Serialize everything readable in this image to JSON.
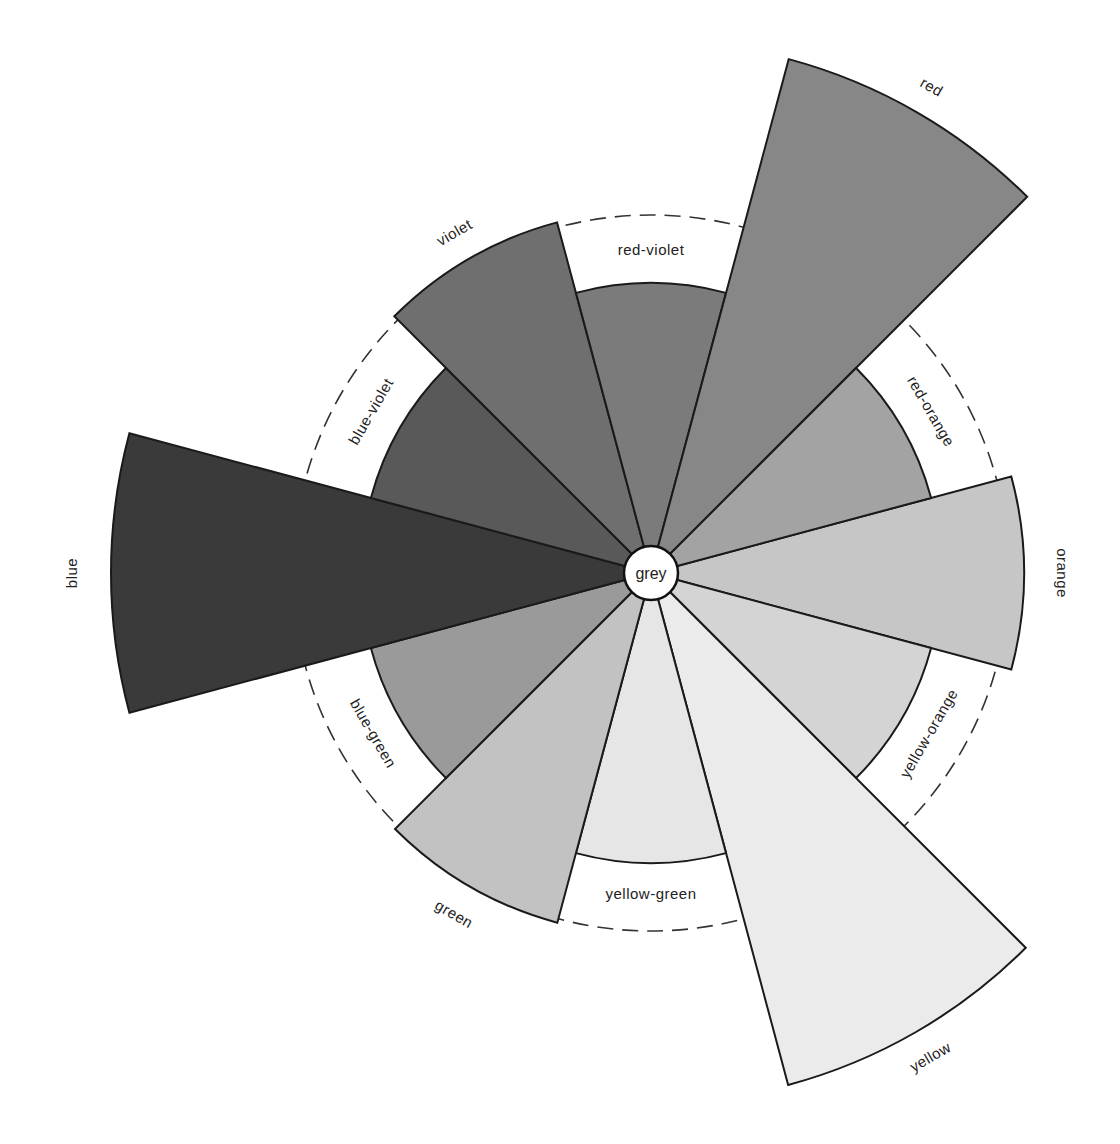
{
  "chart_data": {
    "type": "polar-area",
    "title": "",
    "center_label": "grey",
    "angle_convention": "degrees clockwise from east (screen)",
    "sector_width_deg": 30,
    "reference_ring_radius": 358,
    "inner_disc_radius": 290,
    "categories": [
      "orange",
      "yellow-orange",
      "yellow",
      "yellow-green",
      "green",
      "blue-green",
      "blue",
      "blue-violet",
      "violet",
      "red-violet",
      "red",
      "red-orange"
    ],
    "sectors": [
      {
        "name": "orange",
        "center_angle": 0,
        "radius": 373,
        "tone": "#c6c6c6",
        "label_radius": 410,
        "label_mode": "outer"
      },
      {
        "name": "yellow-orange",
        "center_angle": 30,
        "radius": 290,
        "tone": "#d4d4d4",
        "label_radius": 322,
        "label_mode": "band"
      },
      {
        "name": "yellow",
        "center_angle": 60,
        "radius": 530,
        "tone": "#ebebeb",
        "label_radius": 560,
        "label_mode": "outer"
      },
      {
        "name": "yellow-green",
        "center_angle": 90,
        "radius": 290,
        "tone": "#e6e6e6",
        "label_radius": 322,
        "label_mode": "band"
      },
      {
        "name": "green",
        "center_angle": 120,
        "radius": 362,
        "tone": "#c2c2c2",
        "label_radius": 395,
        "label_mode": "outer"
      },
      {
        "name": "blue-green",
        "center_angle": 150,
        "radius": 290,
        "tone": "#9a9a9a",
        "label_radius": 322,
        "label_mode": "band"
      },
      {
        "name": "blue",
        "center_angle": 180,
        "radius": 540,
        "tone": "#3a3a3a",
        "label_radius": 578,
        "label_mode": "outer"
      },
      {
        "name": "blue-violet",
        "center_angle": 210,
        "radius": 290,
        "tone": "#595959",
        "label_radius": 322,
        "label_mode": "band"
      },
      {
        "name": "violet",
        "center_angle": 240,
        "radius": 363,
        "tone": "#6f6f6f",
        "label_radius": 392,
        "label_mode": "outer"
      },
      {
        "name": "red-violet",
        "center_angle": 270,
        "radius": 290,
        "tone": "#7b7b7b",
        "label_radius": 322,
        "label_mode": "band"
      },
      {
        "name": "red",
        "center_angle": 300,
        "radius": 532,
        "tone": "#878787",
        "label_radius": 560,
        "label_mode": "outer"
      },
      {
        "name": "red-orange",
        "center_angle": 330,
        "radius": 290,
        "tone": "#a3a3a3",
        "label_radius": 322,
        "label_mode": "band"
      }
    ],
    "values": [
      373,
      290,
      530,
      290,
      362,
      290,
      540,
      290,
      363,
      290,
      532,
      290
    ],
    "legend": null,
    "grid": false
  },
  "diagram": {
    "center": {
      "x": 651,
      "y": 573,
      "radius": 27,
      "label": "grey"
    },
    "labels": {
      "orange": "orange",
      "yellow-orange": "yellow-orange",
      "yellow": "yellow",
      "yellow-green": "yellow-green",
      "green": "green",
      "blue-green": "blue-green",
      "blue": "blue",
      "blue-violet": "blue-violet",
      "violet": "violet",
      "red-violet": "red-violet",
      "red": "red",
      "red-orange": "red-orange"
    }
  }
}
